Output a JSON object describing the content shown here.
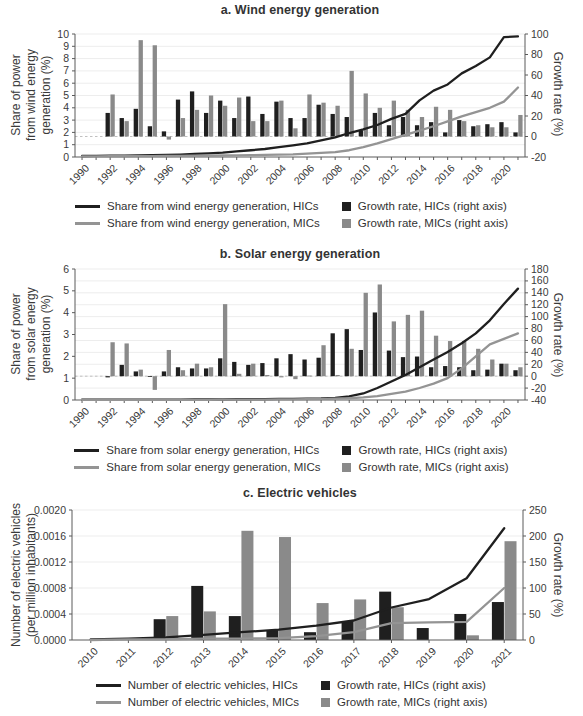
{
  "colors": {
    "hic": "#1f1f1f",
    "mic": "#8a8a8a",
    "mic_line": "#949494",
    "grid": "#ededed",
    "dashed_zero": "#c0c0c0",
    "axis": "#5a5a5a",
    "text": "#3a3a3a"
  },
  "chart_data": [
    {
      "type": "bar+line combo, dual axis",
      "title": "a. Wind energy generation",
      "ylabel_left": "Share of power\nfrom wind energy\ngeneration (%)",
      "ylabel_right": "Growth rate (%)",
      "ylim_left": [
        0,
        10
      ],
      "yticks_left": [
        0,
        1,
        2,
        3,
        4,
        5,
        6,
        7,
        8,
        9,
        10
      ],
      "ylim_right": [
        -20,
        100
      ],
      "yticks_right": [
        -20,
        0,
        20,
        40,
        60,
        80,
        100
      ],
      "grid_axis": "left",
      "zero_line_on_right_axis": true,
      "legend_position": "bottom",
      "x": [
        1990,
        1991,
        1992,
        1993,
        1994,
        1995,
        1996,
        1997,
        1998,
        1999,
        2000,
        2001,
        2002,
        2003,
        2004,
        2005,
        2006,
        2007,
        2008,
        2009,
        2010,
        2011,
        2012,
        2013,
        2014,
        2015,
        2016,
        2017,
        2018,
        2019,
        2020,
        2021
      ],
      "x_tick_labels": [
        "1990",
        "1992",
        "1994",
        "1996",
        "1998",
        "2000",
        "2002",
        "2004",
        "2006",
        "2008",
        "2010",
        "2012",
        "2014",
        "2016",
        "2018",
        "2020"
      ],
      "series": [
        {
          "name": "Share from wind energy generation, HICs",
          "type": "line",
          "axis": "left",
          "color_key": "hic",
          "values": [
            0.08,
            0.09,
            0.1,
            0.11,
            0.13,
            0.15,
            0.17,
            0.2,
            0.25,
            0.3,
            0.35,
            0.45,
            0.55,
            0.65,
            0.8,
            0.95,
            1.1,
            1.35,
            1.6,
            1.95,
            2.25,
            2.6,
            3.1,
            3.5,
            4.6,
            5.4,
            5.9,
            6.8,
            7.4,
            8.1,
            9.75,
            9.8
          ]
        },
        {
          "name": "Share from wind energy generation, MICs",
          "type": "line",
          "axis": "left",
          "color_key": "mic_line",
          "values": [
            0.05,
            0.05,
            0.06,
            0.06,
            0.07,
            0.07,
            0.08,
            0.09,
            0.1,
            0.1,
            0.12,
            0.13,
            0.15,
            0.17,
            0.2,
            0.22,
            0.28,
            0.33,
            0.4,
            0.55,
            0.8,
            1.1,
            1.45,
            1.8,
            2.15,
            2.5,
            2.9,
            3.3,
            3.65,
            4.0,
            4.5,
            5.65
          ]
        },
        {
          "name": "Growth rate, HICs (right axis)",
          "type": "bar",
          "axis": "right",
          "color_key": "hic",
          "values": [
            null,
            null,
            23,
            18,
            27,
            10,
            5,
            36,
            44,
            23,
            35,
            18,
            39,
            22,
            34,
            18,
            18,
            31,
            22,
            19,
            6,
            23,
            11,
            19,
            11,
            14,
            4,
            16,
            10,
            12,
            14,
            4
          ]
        },
        {
          "name": "Growth rate, MICs (right axis)",
          "type": "bar",
          "axis": "right",
          "color_key": "mic",
          "values": [
            null,
            null,
            41,
            15,
            94,
            89,
            -3,
            18,
            26,
            40,
            30,
            38,
            15,
            15,
            35,
            8,
            41,
            33,
            30,
            64,
            42,
            28,
            35,
            26,
            19,
            29,
            26,
            15,
            11,
            9,
            9,
            21
          ]
        }
      ]
    },
    {
      "type": "bar+line combo, dual axis",
      "title": "b. Solar energy generation",
      "ylabel_left": "Share of power\nfrom solar energy\ngeneration (%)",
      "ylabel_right": "Growth rate (%)",
      "ylim_left": [
        0,
        6
      ],
      "yticks_left": [
        0,
        1,
        2,
        3,
        4,
        5,
        6
      ],
      "ylim_right": [
        -40,
        180
      ],
      "yticks_right": [
        -40,
        -20,
        0,
        20,
        40,
        60,
        80,
        100,
        120,
        140,
        160,
        180
      ],
      "grid_axis": "right",
      "zero_line_on_right_axis": true,
      "legend_position": "bottom",
      "x": [
        1990,
        1991,
        1992,
        1993,
        1994,
        1995,
        1996,
        1997,
        1998,
        1999,
        2000,
        2001,
        2002,
        2003,
        2004,
        2005,
        2006,
        2007,
        2008,
        2009,
        2010,
        2011,
        2012,
        2013,
        2014,
        2015,
        2016,
        2017,
        2018,
        2019,
        2020,
        2021
      ],
      "x_tick_labels": [
        "1990",
        "1992",
        "1994",
        "1996",
        "1998",
        "2000",
        "2002",
        "2004",
        "2006",
        "2008",
        "2010",
        "2012",
        "2014",
        "2016",
        "2018",
        "2020"
      ],
      "series": [
        {
          "name": "Share from solar energy generation, HICs",
          "type": "line",
          "axis": "left",
          "color_key": "hic",
          "values": [
            0.02,
            0.02,
            0.02,
            0.02,
            0.02,
            0.02,
            0.02,
            0.02,
            0.03,
            0.03,
            0.03,
            0.04,
            0.04,
            0.04,
            0.05,
            0.05,
            0.06,
            0.07,
            0.1,
            0.17,
            0.3,
            0.55,
            0.85,
            1.15,
            1.5,
            1.85,
            2.2,
            2.6,
            3.05,
            3.65,
            4.4,
            5.1
          ]
        },
        {
          "name": "Share from solar energy generation, MICs",
          "type": "line",
          "axis": "left",
          "color_key": "mic_line",
          "values": [
            0.01,
            0.01,
            0.01,
            0.01,
            0.01,
            0.01,
            0.01,
            0.01,
            0.01,
            0.01,
            0.02,
            0.02,
            0.02,
            0.02,
            0.03,
            0.03,
            0.04,
            0.05,
            0.06,
            0.08,
            0.12,
            0.18,
            0.28,
            0.38,
            0.55,
            0.75,
            1.0,
            1.45,
            2.0,
            2.55,
            2.8,
            3.05
          ]
        },
        {
          "name": "Growth rate, HICs (right axis)",
          "type": "bar",
          "axis": "right",
          "color_key": "hic",
          "values": [
            null,
            null,
            -2,
            19,
            8,
            -1,
            8,
            15,
            13,
            13,
            30,
            24,
            19,
            22,
            30,
            37,
            28,
            31,
            72,
            79,
            44,
            107,
            43,
            32,
            33,
            15,
            17,
            15,
            10,
            11,
            21,
            10
          ]
        },
        {
          "name": "Growth rate, MICs (right axis)",
          "type": "bar",
          "axis": "right",
          "color_key": "mic",
          "values": [
            null,
            null,
            57,
            55,
            11,
            -23,
            44,
            10,
            21,
            15,
            121,
            4,
            21,
            2,
            -2,
            -5,
            1,
            52,
            2,
            46,
            140,
            154,
            92,
            103,
            110,
            68,
            59,
            59,
            46,
            28,
            21,
            15
          ]
        }
      ]
    },
    {
      "type": "bar+line combo, dual axis",
      "title": "c. Electric vehicles",
      "ylabel_left": "Number of electric vehicles\n(per million inhabitants)",
      "ylabel_right": "Growth rate (%)",
      "ylim_left": [
        0,
        0.002
      ],
      "yticks_left": [
        0,
        0.0004,
        0.0008,
        0.0012,
        0.0016,
        0.002
      ],
      "ytick_labels_left": [
        "0.0000",
        "0.0004",
        "0.0008",
        "0.0012",
        "0.0016",
        "0.0020"
      ],
      "ylim_right": [
        0,
        250
      ],
      "yticks_right": [
        0,
        50,
        100,
        150,
        200,
        250
      ],
      "grid_axis": "left",
      "zero_line_on_right_axis": false,
      "legend_position": "bottom",
      "x": [
        2010,
        2011,
        2012,
        2013,
        2014,
        2015,
        2016,
        2017,
        2018,
        2019,
        2020,
        2021
      ],
      "x_tick_labels": [
        "2010",
        "2011",
        "2012",
        "2013",
        "2014",
        "2015",
        "2016",
        "2017",
        "2018",
        "2019",
        "2020",
        "2021"
      ],
      "series": [
        {
          "name": "Number of electric vehicles, HICs",
          "type": "line",
          "axis": "left",
          "color_key": "hic",
          "values": [
            1e-05,
            2e-05,
            4e-05,
            8e-05,
            0.00012,
            0.00016,
            0.00022,
            0.0003,
            0.0005,
            0.00063,
            0.00095,
            0.00172
          ]
        },
        {
          "name": "Number of electric vehicles, MICs",
          "type": "line",
          "axis": "left",
          "color_key": "mic_line",
          "values": [
            0.0,
            1e-05,
            1e-05,
            2e-05,
            2e-05,
            3e-05,
            6e-05,
            0.00012,
            0.00026,
            0.00027,
            0.00028,
            0.0008
          ]
        },
        {
          "name": "Growth rate, HICs (right axis)",
          "type": "bar",
          "axis": "right",
          "color_key": "hic",
          "values": [
            null,
            2,
            40,
            104,
            46,
            19,
            15,
            36,
            93,
            23,
            50,
            73
          ]
        },
        {
          "name": "Growth rate, MICs (right axis)",
          "type": "bar",
          "axis": "right",
          "color_key": "mic",
          "values": [
            null,
            3,
            46,
            55,
            210,
            198,
            71,
            78,
            63,
            null,
            9,
            190
          ]
        }
      ]
    }
  ]
}
